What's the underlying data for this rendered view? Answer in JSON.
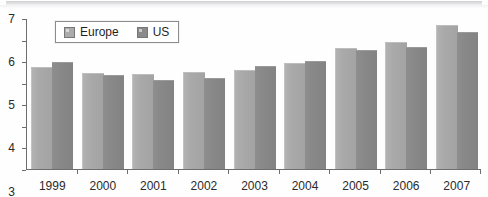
{
  "chart_data": {
    "type": "bar",
    "title": "",
    "xlabel": "",
    "ylabel": "",
    "grid": false,
    "legend_position": "top-left",
    "ylim": [
      0,
      7
    ],
    "yticks": [
      0,
      1,
      2,
      3,
      4,
      5,
      6,
      7
    ],
    "ytick_labels": [
      "0",
      "1",
      "2",
      "3",
      "4",
      "5",
      "6",
      "7"
    ],
    "categories": [
      "1999",
      "2000",
      "2001",
      "2002",
      "2003",
      "2004",
      "2005",
      "2006",
      "2007"
    ],
    "series": [
      {
        "name": "Europe",
        "color": "#ababab",
        "values": [
          4.7,
          4.4,
          4.35,
          4.45,
          4.55,
          4.85,
          5.55,
          5.85,
          6.65
        ]
      },
      {
        "name": "US",
        "color": "#8a8a8a",
        "values": [
          4.9,
          4.3,
          4.1,
          4.15,
          4.75,
          4.95,
          5.45,
          5.6,
          6.3
        ]
      }
    ]
  },
  "legend": {
    "items": [
      {
        "label": "Europe",
        "swatch": "legend-swatch-europe"
      },
      {
        "label": "US",
        "swatch": "legend-swatch-us"
      }
    ]
  }
}
